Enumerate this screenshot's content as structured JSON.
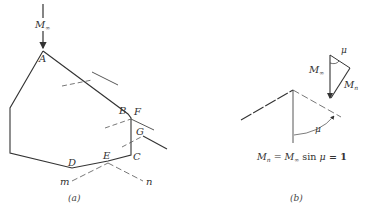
{
  "figure": {
    "panel_a": {
      "caption": "(a)",
      "freestream_label": "M",
      "freestream_sub": "∞",
      "points": {
        "A": "A",
        "B": "B",
        "C": "C",
        "D": "D",
        "E": "E",
        "F": "F",
        "G": "G"
      },
      "line_labels": {
        "m": "m",
        "n": "n"
      }
    },
    "panel_b": {
      "caption": "(b)",
      "mu_label": "μ",
      "mu_label_angle": "μ",
      "m_inf_label": "M",
      "m_inf_sub": "∞",
      "m_n_label": "M",
      "m_n_sub": "n",
      "equation": {
        "lhs": "M",
        "lhs_sub": "n",
        "eq1": " = ",
        "m": "M",
        "m_sub": "∞",
        "sin": " sin ",
        "mu": "μ",
        "rhs": " = 1"
      }
    },
    "colors": {
      "line": "#333333",
      "dashed": "#555555",
      "text": "#333333"
    }
  }
}
